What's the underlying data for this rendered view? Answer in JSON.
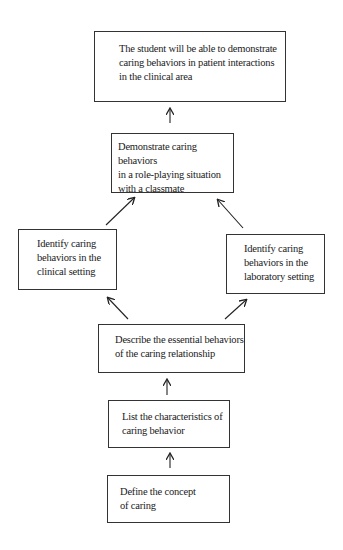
{
  "diagram": {
    "type": "flowchart",
    "nodes": [
      {
        "id": "goal",
        "lines": [
          "The student will be able to demonstrate",
          "caring behaviors in patient interactions",
          "in the clinical area"
        ]
      },
      {
        "id": "roleplay",
        "lines": [
          "Demonstrate caring behaviors",
          "in a role-playing situation",
          "with a classmate"
        ]
      },
      {
        "id": "clinical",
        "lines": [
          "Identify caring",
          "behaviors in the",
          "clinical setting"
        ]
      },
      {
        "id": "laboratory",
        "lines": [
          "Identify caring",
          "behaviors in the",
          "laboratory setting"
        ]
      },
      {
        "id": "describe",
        "lines": [
          "Describe the essential behaviors",
          "of the caring relationship"
        ]
      },
      {
        "id": "list",
        "lines": [
          "List the characteristics of",
          "caring behavior"
        ]
      },
      {
        "id": "define",
        "lines": [
          "Define the concept",
          "of caring"
        ]
      }
    ],
    "edges": [
      {
        "from": "define",
        "to": "list"
      },
      {
        "from": "list",
        "to": "describe"
      },
      {
        "from": "describe",
        "to": "clinical"
      },
      {
        "from": "describe",
        "to": "laboratory"
      },
      {
        "from": "clinical",
        "to": "roleplay"
      },
      {
        "from": "laboratory",
        "to": "roleplay"
      },
      {
        "from": "roleplay",
        "to": "goal"
      }
    ]
  }
}
